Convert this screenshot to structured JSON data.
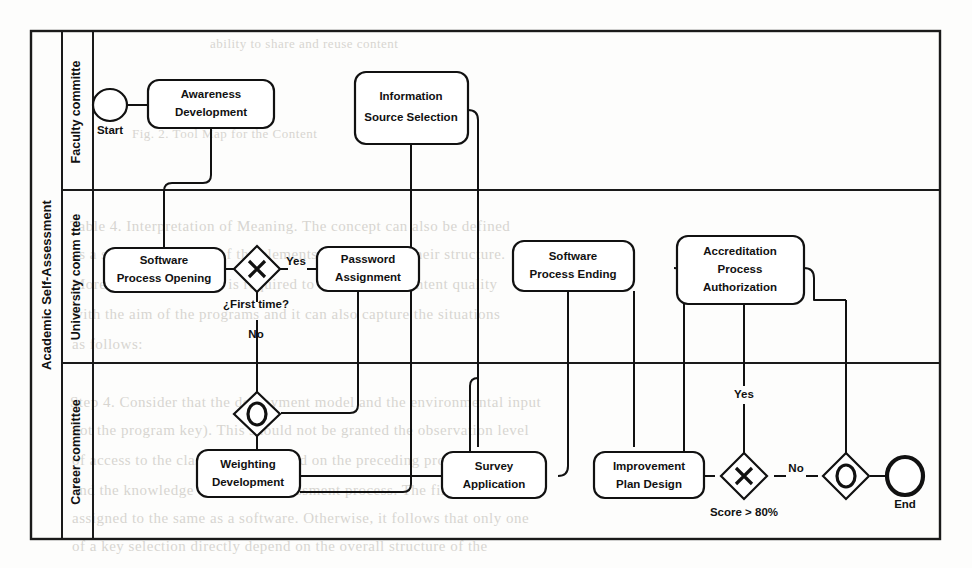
{
  "document": {
    "type": "bpmn-diagram",
    "source_medium": "scanned page",
    "pool": {
      "label": "Academic Self-Assessment"
    },
    "lanes": [
      {
        "id": "faculty",
        "label": "Faculty committe"
      },
      {
        "id": "university",
        "label": "University comm ttee"
      },
      {
        "id": "career",
        "label": "Career committee"
      }
    ]
  },
  "nodes": {
    "start_event": {
      "label": "Start",
      "type": "start-event",
      "lane": "faculty"
    },
    "end_event": {
      "label": "End",
      "type": "end-event",
      "lane": "career"
    },
    "awareness": {
      "label_line1": "Awareness",
      "label_line2": "Development",
      "type": "task",
      "lane": "faculty"
    },
    "info_source": {
      "label_line1": "Information",
      "label_line2": "Source Selection",
      "type": "task",
      "lane": "faculty"
    },
    "sw_opening": {
      "label_line1": "Software",
      "label_line2": "Process Opening",
      "type": "task",
      "lane": "university"
    },
    "password": {
      "label_line1": "Password",
      "label_line2": "Assignment",
      "type": "task",
      "lane": "university"
    },
    "sw_ending": {
      "label_line1": "Software",
      "label_line2": "Process Ending",
      "type": "task",
      "lane": "university"
    },
    "accreditation": {
      "label_line1": "Accreditation",
      "label_line2": "Process",
      "label_line3": "Authorization",
      "type": "task",
      "lane": "university"
    },
    "weighting": {
      "label_line1": "Weighting",
      "label_line2": "Development",
      "type": "task",
      "lane": "career"
    },
    "survey": {
      "label_line1": "Survey",
      "label_line2": "Application",
      "type": "task",
      "lane": "career"
    },
    "improvement": {
      "label_line1": "Improvement",
      "label_line2": "Plan Design",
      "type": "task",
      "lane": "career"
    },
    "gw_firsttime": {
      "label": "¿First time?",
      "type": "exclusive-gateway",
      "lane": "university"
    },
    "gw_merge1": {
      "label": "",
      "type": "inclusive-gateway",
      "lane": "career"
    },
    "gw_score": {
      "label": "Score > 80%",
      "type": "exclusive-gateway",
      "lane": "career"
    },
    "gw_merge2": {
      "label": "",
      "type": "inclusive-gateway",
      "lane": "career"
    }
  },
  "flow_labels": {
    "first_time_yes": "Yes",
    "first_time_no": "No",
    "score_yes": "Yes",
    "score_no": "No"
  },
  "colors": {
    "stroke": "#111111",
    "paper": "#fdfdfc",
    "ghost_text": "#b9b5ae"
  },
  "background_text": [
    {
      "text": "ability to share and reuse content",
      "x": 210,
      "y": 36,
      "size": 13
    },
    {
      "text": "Fig. 2.  Tool Map for the Content",
      "x": 132,
      "y": 126,
      "size": 13
    },
    {
      "text": "Table 4.  Interpretation of  Meaning.  The concept  can  also  be  defined",
      "x": 70,
      "y": 218,
      "size": 15
    },
    {
      "text": "as  a  situation  in  terms  of  the  elements  involved  and  their  structure.",
      "x": 72,
      "y": 246,
      "size": 15
    },
    {
      "text": "Moreover,  the  structure  is  required  to  measure  the  content  quality",
      "x": 72,
      "y": 276,
      "size": 15
    },
    {
      "text": "with  the  aim  of  the  programs  and  it  can  also  capture  the  situations",
      "x": 72,
      "y": 306,
      "size": 15
    },
    {
      "text": "as follows:",
      "x": 72,
      "y": 336,
      "size": 15
    },
    {
      "text": "Step 4.  Consider that the  deployment  model  and  the  environmental  input",
      "x": 70,
      "y": 394,
      "size": 15
    },
    {
      "text": "not  the  program  key).  This  should  not  be  granted  the  observation  level",
      "x": 72,
      "y": 422,
      "size": 15
    },
    {
      "text": "of  access  to  the  class  which  is  based  on  the  preceding  procedures",
      "x": 72,
      "y": 452,
      "size": 15
    },
    {
      "text": "and the knowledge of  the  self-assessment  process.  The  first  input  is",
      "x": 72,
      "y": 482,
      "size": 15
    },
    {
      "text": "assigned to the  same  as  a  software.  Otherwise,  it  follows  that  only  one",
      "x": 72,
      "y": 510,
      "size": 15
    },
    {
      "text": "of  a  key  selection  directly  depend  on  the  overall  structure  of  the",
      "x": 72,
      "y": 538,
      "size": 15
    }
  ]
}
